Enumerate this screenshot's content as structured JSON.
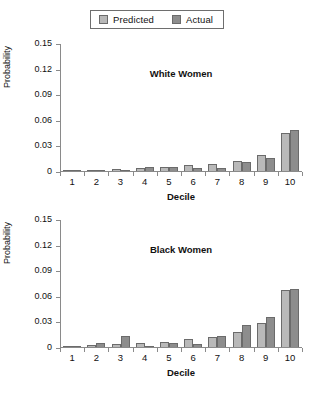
{
  "legend": {
    "entries": [
      {
        "label": "Predicted",
        "swatch": "legend-swatch-predicted",
        "color": "#b9b9b9"
      },
      {
        "label": "Actual",
        "swatch": "legend-swatch-actual",
        "color": "#8d8d8d"
      }
    ]
  },
  "chart_data": [
    {
      "type": "bar",
      "title": "White Women",
      "xlabel": "Decile",
      "ylabel": "Probability",
      "categories": [
        "1",
        "2",
        "3",
        "4",
        "5",
        "6",
        "7",
        "8",
        "9",
        "10"
      ],
      "series": [
        {
          "name": "Predicted",
          "color": "#b9b9b9",
          "values": [
            0.0007,
            0.0015,
            0.0025,
            0.0035,
            0.0045,
            0.0065,
            0.0085,
            0.012,
            0.0185,
            0.0445
          ]
        },
        {
          "name": "Actual",
          "color": "#8d8d8d",
          "values": [
            0.0005,
            0.0012,
            0.0007,
            0.0045,
            0.0042,
            0.0035,
            0.003,
            0.0105,
            0.0155,
            0.048
          ]
        }
      ],
      "ylim": [
        0,
        0.15
      ],
      "yticks": [
        "0",
        "0.03",
        "0.06",
        "0.09",
        "0.12",
        "0.15"
      ],
      "ytickvalues": [
        0,
        0.03,
        0.06,
        0.09,
        0.12,
        0.15
      ],
      "grid": false,
      "legend_position": "top-center"
    },
    {
      "type": "bar",
      "title": "Black Women",
      "xlabel": "Decile",
      "ylabel": "Probability",
      "categories": [
        "1",
        "2",
        "3",
        "4",
        "5",
        "6",
        "7",
        "8",
        "9",
        "10"
      ],
      "series": [
        {
          "name": "Predicted",
          "color": "#b9b9b9",
          "values": [
            0.001,
            0.0025,
            0.0035,
            0.0045,
            0.006,
            0.0095,
            0.0115,
            0.0175,
            0.028,
            0.0665
          ]
        },
        {
          "name": "Actual",
          "color": "#8d8d8d",
          "values": [
            0.0008,
            0.0045,
            0.0125,
            0.0002,
            0.0045,
            0.0035,
            0.0125,
            0.0255,
            0.035,
            0.0675
          ]
        }
      ],
      "ylim": [
        0,
        0.15
      ],
      "yticks": [
        "0",
        "0.03",
        "0.06",
        "0.09",
        "0.12",
        "0.15"
      ],
      "ytickvalues": [
        0,
        0.03,
        0.06,
        0.09,
        0.12,
        0.15
      ],
      "grid": false,
      "legend_position": "top-center"
    }
  ]
}
